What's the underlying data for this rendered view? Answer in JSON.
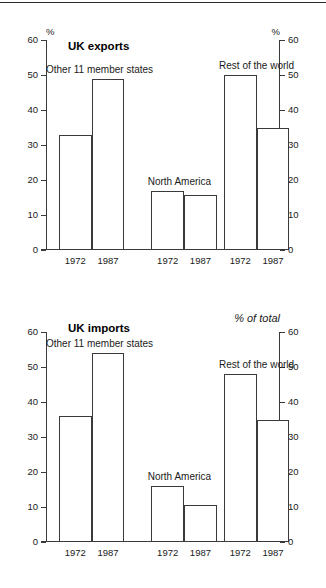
{
  "figure": {
    "background": "#ffffff",
    "line_color": "#3a3a3a",
    "text_color": "#1a1a1a"
  },
  "charts": [
    {
      "id": "chart-exports",
      "title": "UK exports",
      "unit_left": "%",
      "unit_right": "%",
      "unit_right_italic": false
    },
    {
      "id": "chart-imports",
      "title": "UK imports",
      "unit_left": "",
      "unit_right": "% of total",
      "unit_right_italic": true
    }
  ],
  "axis": {
    "ticks": [
      "60",
      "50",
      "40",
      "30",
      "20",
      "10",
      "0"
    ]
  },
  "groups": {
    "eu": "Other 11 member states",
    "na": "North America",
    "row": "Rest of the world"
  },
  "years": {
    "y1": "1972",
    "y2": "1987"
  },
  "chart_data": [
    {
      "type": "bar",
      "title": "UK exports",
      "xlabel": "",
      "ylabel": "%",
      "ylim": [
        0,
        60
      ],
      "yticks": [
        0,
        10,
        20,
        30,
        40,
        50,
        60
      ],
      "grid": false,
      "legend": "none",
      "categories": [
        "Other 11 member states 1972",
        "Other 11 member states 1987",
        "North America 1972",
        "North America 1987",
        "Rest of the world 1972",
        "Rest of the world 1987"
      ],
      "values": [
        33,
        49,
        17,
        15.8,
        50,
        35
      ],
      "groups": [
        {
          "name": "Other 11 member states",
          "bars": [
            {
              "year": "1972",
              "value": 33
            },
            {
              "year": "1987",
              "value": 49
            }
          ]
        },
        {
          "name": "North America",
          "bars": [
            {
              "year": "1972",
              "value": 17
            },
            {
              "year": "1987",
              "value": 15.8
            }
          ]
        },
        {
          "name": "Rest of the world",
          "bars": [
            {
              "year": "1972",
              "value": 50
            },
            {
              "year": "1987",
              "value": 35
            }
          ]
        }
      ]
    },
    {
      "type": "bar",
      "title": "UK imports",
      "xlabel": "",
      "ylabel": "% of total",
      "ylim": [
        0,
        60
      ],
      "yticks": [
        0,
        10,
        20,
        30,
        40,
        50,
        60
      ],
      "grid": false,
      "legend": "none",
      "categories": [
        "Other 11 member states 1972",
        "Other 11 member states 1987",
        "North America 1972",
        "North America 1987",
        "Rest of the world 1972",
        "Rest of the world 1987"
      ],
      "values": [
        36,
        54,
        16,
        10.5,
        48,
        35
      ],
      "groups": [
        {
          "name": "Other 11 member states",
          "bars": [
            {
              "year": "1972",
              "value": 36
            },
            {
              "year": "1987",
              "value": 54
            }
          ]
        },
        {
          "name": "North America",
          "bars": [
            {
              "year": "1972",
              "value": 16
            },
            {
              "year": "1987",
              "value": 10.5
            }
          ]
        },
        {
          "name": "Rest of the world",
          "bars": [
            {
              "year": "1972",
              "value": 48
            },
            {
              "year": "1987",
              "value": 35
            }
          ]
        }
      ]
    }
  ]
}
